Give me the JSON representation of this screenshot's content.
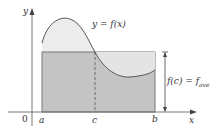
{
  "figure": {
    "type": "mean-value-theorem-for-integrals",
    "curve_label": "y = f(x)",
    "axis_x_label": "x",
    "axis_y_label": "y",
    "origin_label": "0",
    "tick_labels": {
      "a": "a",
      "c": "c",
      "b": "b"
    },
    "height_label_main": "f(c) = f",
    "height_label_sub": "ave",
    "colors": {
      "curve_area_fill": "#ececec",
      "rectangle_fill": "#c4c4c4",
      "stroke": "#555555",
      "axis": "#666666"
    }
  }
}
